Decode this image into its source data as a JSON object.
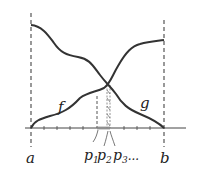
{
  "diagram": {
    "curves": [
      {
        "name": "f",
        "label": "f",
        "direction": "increasing"
      },
      {
        "name": "g",
        "label": "g",
        "direction": "decreasing"
      }
    ],
    "axis": {
      "left_label": "a",
      "right_label": "b",
      "points": [
        {
          "label_main": "p",
          "label_sub": "1",
          "suffix": ""
        },
        {
          "label_main": "p",
          "label_sub": "2",
          "suffix": ""
        },
        {
          "label_main": "p",
          "label_sub": "3",
          "suffix": "..."
        }
      ]
    },
    "colors": {
      "curve": "#333333",
      "axis": "#444444",
      "dashed": "#555555"
    }
  }
}
